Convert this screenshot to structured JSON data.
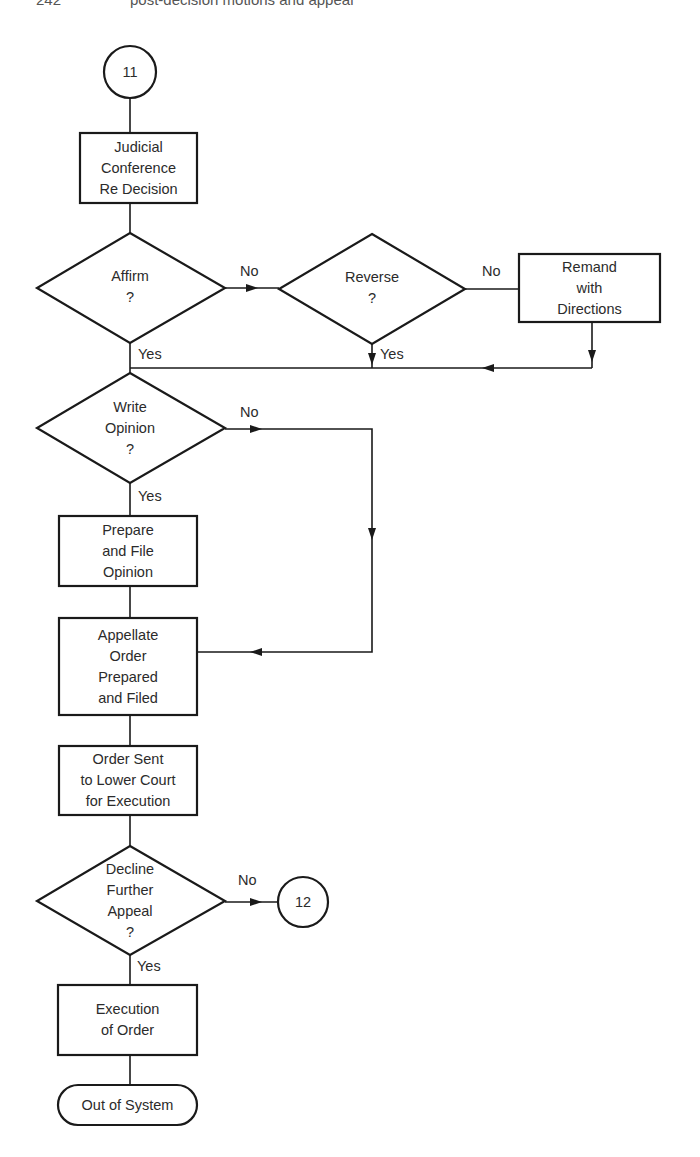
{
  "page_header": {
    "left": "242",
    "running_title": "post-decision motions and appeal"
  },
  "diagram": {
    "type": "flowchart",
    "stroke_color": "#1a1a1a",
    "text_color": "#2b2b2b",
    "nodes": {
      "start": {
        "kind": "connector",
        "label": "11"
      },
      "conference": {
        "kind": "process",
        "label": "Judicial\nConference\nRe Decision"
      },
      "affirm": {
        "kind": "decision",
        "label": "Affirm\n?"
      },
      "reverse": {
        "kind": "decision",
        "label": "Reverse\n?"
      },
      "remand": {
        "kind": "process",
        "label": "Remand\nwith\nDirections"
      },
      "write_opinion": {
        "kind": "decision",
        "label": "Write\nOpinion\n?"
      },
      "prepare_opinion": {
        "kind": "process",
        "label": "Prepare\nand File\nOpinion"
      },
      "appellate_order": {
        "kind": "process",
        "label": "Appellate\nOrder\nPrepared\nand Filed"
      },
      "order_sent": {
        "kind": "process",
        "label": "Order Sent\nto Lower Court\nfor Execution"
      },
      "decline_appeal": {
        "kind": "decision",
        "label": "Decline\nFurther\nAppeal\n?"
      },
      "connector_12": {
        "kind": "connector",
        "label": "12"
      },
      "execution": {
        "kind": "process",
        "label": "Execution\nof Order"
      },
      "end": {
        "kind": "terminal",
        "label": "Out of System"
      }
    },
    "edge_labels": {
      "affirm_no": "No",
      "affirm_yes": "Yes",
      "reverse_no": "No",
      "reverse_yes": "Yes",
      "write_no": "No",
      "write_yes": "Yes",
      "decline_no": "No",
      "decline_yes": "Yes"
    },
    "edges": [
      {
        "from": "start",
        "to": "conference"
      },
      {
        "from": "conference",
        "to": "affirm"
      },
      {
        "from": "affirm",
        "to": "reverse",
        "label": "No"
      },
      {
        "from": "affirm",
        "to": "write_opinion",
        "label": "Yes"
      },
      {
        "from": "reverse",
        "to": "remand",
        "label": "No"
      },
      {
        "from": "reverse",
        "to": "write_opinion",
        "label": "Yes"
      },
      {
        "from": "remand",
        "to": "write_opinion"
      },
      {
        "from": "write_opinion",
        "to": "prepare_opinion",
        "label": "Yes"
      },
      {
        "from": "write_opinion",
        "to": "appellate_order",
        "label": "No"
      },
      {
        "from": "prepare_opinion",
        "to": "appellate_order"
      },
      {
        "from": "appellate_order",
        "to": "order_sent"
      },
      {
        "from": "order_sent",
        "to": "decline_appeal"
      },
      {
        "from": "decline_appeal",
        "to": "connector_12",
        "label": "No"
      },
      {
        "from": "decline_appeal",
        "to": "execution",
        "label": "Yes"
      },
      {
        "from": "execution",
        "to": "end"
      }
    ]
  }
}
